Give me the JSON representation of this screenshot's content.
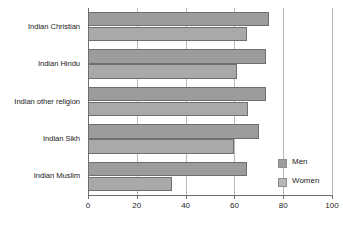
{
  "chart_data": {
    "type": "bar",
    "orientation": "horizontal",
    "title": "",
    "xlabel": "",
    "ylabel": "",
    "xlim": [
      0,
      100
    ],
    "xticks": [
      0,
      20,
      40,
      60,
      80,
      100
    ],
    "xtick_labels": [
      "0",
      "20",
      "40",
      "60",
      "80",
      "100"
    ],
    "grid": "vertical",
    "legend_position": "inside-bottom-right",
    "categories": [
      "Indian Christian",
      "Indian Hindu",
      "Indian other religion",
      "Indian Sikh",
      "Indian Muslim"
    ],
    "series": [
      {
        "name": "Men",
        "color": "#9c9c9c",
        "values": [
          74,
          73,
          73,
          70,
          65
        ]
      },
      {
        "name": "Women",
        "color": "#a9a9a9",
        "values": [
          65,
          61,
          65.5,
          60,
          34.5
        ]
      }
    ]
  },
  "legend": {
    "items": [
      {
        "label": "Men"
      },
      {
        "label": "Women"
      }
    ]
  },
  "colors": {
    "men_bar": "#9c9c9c",
    "women_bar": "#a9a9a9",
    "gridline": "#b8b8b8",
    "axis": "#6d6d6d",
    "text": "#222222",
    "background": "#ffffff"
  }
}
